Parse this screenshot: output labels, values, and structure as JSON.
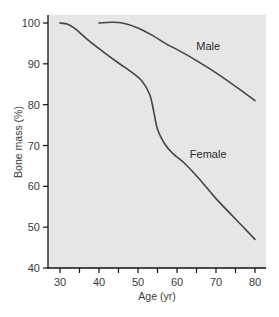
{
  "chart_data": {
    "type": "line",
    "title": "",
    "xlabel": "Age (yr)",
    "ylabel": "Bone mass (%)",
    "xlim": [
      27,
      83
    ],
    "ylim": [
      40,
      101.5
    ],
    "xticks": [
      30,
      40,
      50,
      60,
      70,
      80
    ],
    "yticks": [
      40,
      50,
      60,
      70,
      80,
      90,
      100
    ],
    "grid": false,
    "legend": "inline labels",
    "background": "#e6e6e6",
    "line_color": "#444444",
    "series": [
      {
        "name": "Male",
        "label_pos": [
          68,
          93.5
        ],
        "points": [
          [
            40,
            100
          ],
          [
            43,
            100.2
          ],
          [
            46,
            100
          ],
          [
            50,
            98.8
          ],
          [
            54,
            96.8
          ],
          [
            57,
            95
          ],
          [
            61,
            93
          ],
          [
            65,
            90.8
          ],
          [
            70,
            87.8
          ],
          [
            75,
            84.5
          ],
          [
            80,
            81
          ]
        ]
      },
      {
        "name": "Female",
        "label_pos": [
          68,
          67
        ],
        "points": [
          [
            30,
            100
          ],
          [
            32,
            99.7
          ],
          [
            34,
            98.5
          ],
          [
            37,
            96
          ],
          [
            41,
            93
          ],
          [
            45,
            90.2
          ],
          [
            48,
            88.2
          ],
          [
            51,
            85.8
          ],
          [
            53,
            82.5
          ],
          [
            54,
            78.5
          ],
          [
            55,
            74
          ],
          [
            57,
            70.2
          ],
          [
            59,
            68
          ],
          [
            62,
            65.6
          ],
          [
            66,
            61.5
          ],
          [
            70,
            57
          ],
          [
            75,
            52
          ],
          [
            80,
            47
          ]
        ]
      }
    ]
  }
}
